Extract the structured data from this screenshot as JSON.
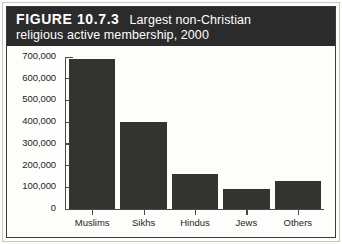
{
  "figure": {
    "number_label": "FIGURE 10.7.3",
    "caption_line1": "Largest non-Christian",
    "caption_line2": "religious active membership, 2000",
    "banner_color": "#2b2b2b",
    "banner_text_color": "#ffffff",
    "bar_color": "#333331",
    "axis_color": "#4a4a48",
    "background_color": "#fdfdfb"
  },
  "chart_data": {
    "type": "bar",
    "categories": [
      "Muslims",
      "Sikhs",
      "Hindus",
      "Jews",
      "Others"
    ],
    "values": [
      690000,
      400000,
      160000,
      90000,
      130000
    ],
    "xlabel": "",
    "ylabel": "",
    "ylim": [
      0,
      700000
    ],
    "ytick_values": [
      700000,
      600000,
      500000,
      400000,
      300000,
      200000,
      100000,
      0
    ],
    "ytick_labels": [
      "700,000",
      "600,000",
      "500,000",
      "400,000",
      "300,000",
      "200,000",
      "100,000",
      "0"
    ],
    "grid": false,
    "legend": false
  }
}
